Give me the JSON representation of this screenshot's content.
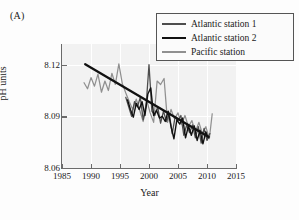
{
  "panel": {
    "label": "(A)"
  },
  "axes": {
    "xlabel": "Year",
    "ylabel": "pH units",
    "xticks": [
      "1985",
      "1990",
      "1995",
      "2000",
      "2005",
      "2010",
      "2015"
    ],
    "yticks": [
      "8.12",
      "8.09",
      "8.06"
    ]
  },
  "legend": {
    "items": [
      {
        "label": "Atlantic station 1",
        "color": "#4d4d4d",
        "width": 1.6
      },
      {
        "label": "Atlantic station 2",
        "color": "#111111",
        "width": 2.4
      },
      {
        "label": "Pacific station",
        "color": "#909090",
        "width": 1.6
      }
    ]
  },
  "chart_data": {
    "type": "line",
    "title": "",
    "xlabel": "Year",
    "ylabel": "pH units",
    "xlim": [
      1985,
      2015
    ],
    "ylim": [
      8.06,
      8.132
    ],
    "grid": true,
    "legend_position": "top-right",
    "annotations": [
      {
        "text": "(A)",
        "position": "top-left"
      }
    ],
    "trend_line": {
      "name": "linear trend",
      "color": "#111111",
      "x": [
        1989.0,
        2010.3
      ],
      "y": [
        8.1203,
        8.078
      ]
    },
    "series": [
      {
        "name": "Atlantic station 1",
        "color": "#4d4d4d",
        "x": [
          1996,
          1996.5,
          1997,
          1997.5,
          1998,
          1998.5,
          1999,
          1999.5,
          2000,
          2000.5,
          2001,
          2001.5,
          2002,
          2002.5,
          2003,
          2003.5,
          2004,
          2004.5,
          2005,
          2005.5,
          2006,
          2006.5,
          2007,
          2007.5,
          2008,
          2008.5,
          2009,
          2009.5,
          2010,
          2010.5
        ],
        "y": [
          8.101,
          8.0955,
          8.09,
          8.0985,
          8.0955,
          8.101,
          8.088,
          8.096,
          8.12,
          8.093,
          8.0905,
          8.0955,
          8.086,
          8.093,
          8.087,
          8.0915,
          8.08,
          8.0895,
          8.0875,
          8.0905,
          8.079,
          8.085,
          8.0805,
          8.085,
          8.0775,
          8.084,
          8.0745,
          8.083,
          8.076,
          8.08
        ]
      },
      {
        "name": "Atlantic station 2",
        "color": "#111111",
        "x": [
          1996.3,
          1996.8,
          1997.3,
          1997.8,
          1998.3,
          1998.8,
          1999.3,
          1999.8,
          2000.3,
          2000.8,
          2001.3,
          2001.8,
          2002.3,
          2002.8,
          2003.3,
          2003.8,
          2004.3,
          2004.8,
          2005.3,
          2005.8,
          2006.3,
          2006.8,
          2007.3,
          2007.8,
          2008.3,
          2008.8,
          2009.3,
          2009.8,
          2010.2
        ],
        "y": [
          8.0995,
          8.094,
          8.0895,
          8.0975,
          8.094,
          8.0985,
          8.0905,
          8.103,
          8.1065,
          8.0905,
          8.0935,
          8.089,
          8.09,
          8.087,
          8.093,
          8.084,
          8.077,
          8.088,
          8.0855,
          8.089,
          8.0775,
          8.0845,
          8.079,
          8.0845,
          8.076,
          8.082,
          8.074,
          8.081,
          8.0775
        ]
      },
      {
        "name": "Pacific station",
        "color": "#909090",
        "x": [
          1988.8,
          1989.4,
          1990.0,
          1990.6,
          1991.2,
          1991.8,
          1992.4,
          1993.0,
          1993.6,
          1994.2,
          1994.8,
          1995.4,
          1996.0,
          1996.6,
          1997.2,
          1997.8,
          1998.4,
          1999.0,
          1999.6,
          2000.2,
          2000.8,
          2001.4,
          2002.0,
          2002.6,
          2003.2,
          2003.8,
          2004.4,
          2005.0,
          2005.6,
          2006.2,
          2006.8,
          2007.4,
          2008.0,
          2008.6,
          2009.2,
          2009.8,
          2010.4,
          2010.9
        ],
        "y": [
          8.1095,
          8.106,
          8.1125,
          8.1075,
          8.1145,
          8.104,
          8.1105,
          8.105,
          8.115,
          8.1085,
          8.1205,
          8.109,
          8.1035,
          8.0985,
          8.094,
          8.1,
          8.0935,
          8.087,
          8.0995,
          8.092,
          8.0865,
          8.1105,
          8.1085,
          8.112,
          8.0865,
          8.094,
          8.0885,
          8.092,
          8.0855,
          8.0905,
          8.084,
          8.0875,
          8.081,
          8.0865,
          8.08,
          8.084,
          8.077,
          8.0915
        ]
      }
    ]
  }
}
